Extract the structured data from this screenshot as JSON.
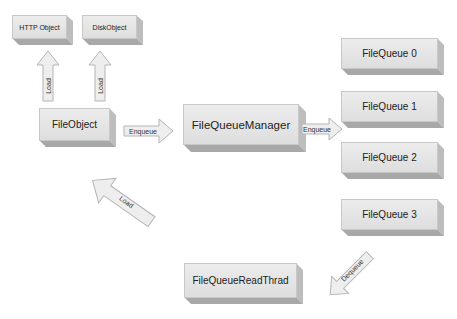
{
  "diagram": {
    "nodes": {
      "http_object": "HTTP Object",
      "disk_object": "DiskObject",
      "file_object": "FileObject",
      "file_queue_manager": "FileQueueManager",
      "file_queue_0": "FileQueue 0",
      "file_queue_1": "FileQueue 1",
      "file_queue_2": "FileQueue 2",
      "file_queue_3": "FileQueue 3",
      "file_queue_read_thread": "FileQueueReadThrad"
    },
    "edges": {
      "load_http": "Load",
      "load_disk": "Load",
      "enqueue_manager": "Enqueue",
      "enqueue_queues": "Enqueue",
      "dequeue": "Dequeue",
      "load_back": "Load"
    },
    "colors": {
      "box_face": "#e6e6e6",
      "box_side": "#bdbdbd",
      "box_bottom": "#a8a8a8",
      "arrow_fill": "#eeeeee",
      "arrow_stroke": "#b5b5b5"
    }
  }
}
